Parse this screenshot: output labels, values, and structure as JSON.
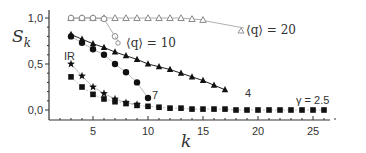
{
  "chart_data": {
    "type": "line",
    "title": "",
    "xlabel": "k",
    "ylabel": "S_k",
    "xlim": [
      1,
      27
    ],
    "ylim": [
      -0.05,
      1.05
    ],
    "xticks": [
      5,
      10,
      15,
      20,
      25
    ],
    "xtick_labels": [
      "5",
      "10",
      "15",
      "20",
      "25"
    ],
    "yticks": [
      0.0,
      0.5,
      1.0
    ],
    "ytick_labels": [
      "0,0",
      "0,5",
      "1,0"
    ],
    "grid": false,
    "series": [
      {
        "name": "<q> = 20",
        "marker": "open-triangle",
        "color": "#888888",
        "x": [
          3,
          4,
          5,
          6,
          7,
          8,
          9,
          10,
          11,
          12,
          13,
          14,
          15
        ],
        "y": [
          1.0,
          1.0,
          1.0,
          1.0,
          1.0,
          1.0,
          1.0,
          1.0,
          1.0,
          1.0,
          1.0,
          0.99,
          0.98
        ]
      },
      {
        "name": "<q> = 10",
        "marker": "open-circle",
        "color": "#888888",
        "x": [
          3,
          4,
          5,
          6,
          7
        ],
        "y": [
          1.0,
          1.0,
          1.0,
          0.99,
          0.8
        ]
      },
      {
        "name": "4",
        "marker": "filled-triangle",
        "color": "#111111",
        "x": [
          3,
          4,
          5,
          6,
          7,
          8,
          9,
          10,
          11,
          12,
          13,
          14,
          15,
          16,
          17
        ],
        "y": [
          0.82,
          0.77,
          0.72,
          0.68,
          0.63,
          0.59,
          0.55,
          0.5,
          0.47,
          0.44,
          0.4,
          0.36,
          0.32,
          0.27,
          0.22
        ]
      },
      {
        "name": "7",
        "marker": "filled-circle",
        "color": "#111111",
        "x": [
          3,
          4,
          5,
          6,
          7,
          8,
          9,
          10
        ],
        "y": [
          0.8,
          0.73,
          0.66,
          0.6,
          0.5,
          0.41,
          0.3,
          0.13
        ]
      },
      {
        "name": "IR",
        "marker": "filled-star",
        "color": "#111111",
        "x": [
          3,
          4,
          5,
          6,
          7,
          8,
          9
        ],
        "y": [
          0.5,
          0.37,
          0.25,
          0.18,
          0.12,
          0.08,
          0.06
        ]
      },
      {
        "name": "γ = 2.5",
        "marker": "filled-square",
        "color": "#111111",
        "x": [
          3,
          4,
          5,
          6,
          7,
          8,
          9,
          10,
          11,
          12,
          13,
          14,
          15,
          16,
          17,
          18,
          19,
          20,
          21,
          22,
          23,
          24,
          25,
          26
        ],
        "y": [
          0.36,
          0.25,
          0.17,
          0.12,
          0.09,
          0.07,
          0.05,
          0.04,
          0.03,
          0.02,
          0.02,
          0.01,
          0.01,
          0.01,
          0.01,
          0.0,
          0.0,
          0.0,
          0.0,
          0.0,
          0.0,
          0.0,
          0.0,
          0.0
        ]
      }
    ],
    "annotations": [
      {
        "text": "⟨q⟩ = 20",
        "near_series": "<q> = 20"
      },
      {
        "text": "⟨q⟩ = 10",
        "near_series": "<q> = 10"
      },
      {
        "text": "IR",
        "near_series": "IR"
      },
      {
        "text": "7",
        "near_series": "7"
      },
      {
        "text": "4",
        "near_series": "4"
      },
      {
        "text": "γ = 2.5",
        "near_series": "γ = 2.5"
      }
    ]
  },
  "labels": {
    "y_axis": "S",
    "y_axis_sub": "k",
    "x_axis": "k",
    "ann_q20": "⟨q⟩ = 20",
    "ann_q10": "⟨q⟩ = 10",
    "ann_ir": "IR",
    "ann_7": "7",
    "ann_4": "4",
    "ann_gamma": "γ = 2.5"
  }
}
